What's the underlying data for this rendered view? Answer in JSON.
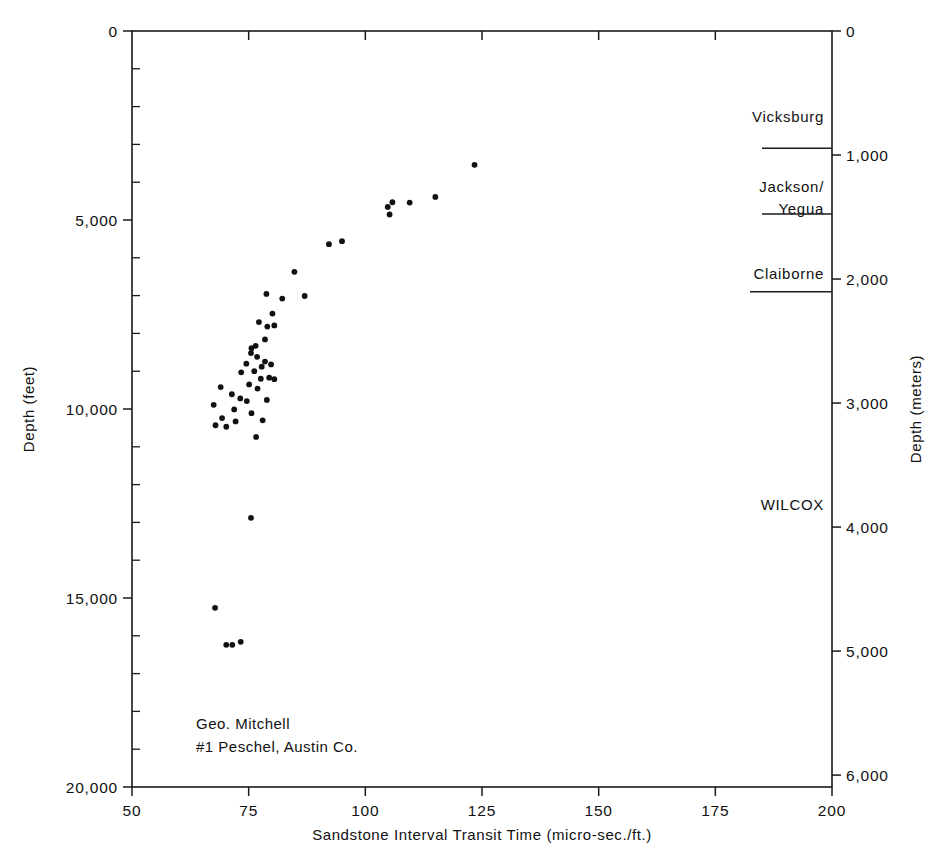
{
  "chart_data": {
    "type": "scatter",
    "title": "",
    "xlabel": "Sandstone Interval Transit Time (micro-sec./ft.)",
    "ylabel": "Depth (feet)",
    "y2label": "Depth (meters)",
    "xlim": [
      50,
      200
    ],
    "ylim": [
      20000,
      0
    ],
    "y2lim": [
      6096,
      0
    ],
    "grid": false,
    "legend": null,
    "xticks": [
      50,
      75,
      100,
      125,
      150,
      175,
      200
    ],
    "xtick_labels": [
      "50",
      "75",
      "100",
      "125",
      "150",
      "175",
      "200"
    ],
    "yticks": [
      0,
      5000,
      10000,
      15000,
      20000
    ],
    "ytick_labels": [
      "0",
      "5,000",
      "10,000",
      "15,000",
      "20,000"
    ],
    "ytick_minor_step": 1000,
    "y2ticks": [
      0,
      1000,
      2000,
      3000,
      4000,
      5000,
      6000
    ],
    "y2tick_labels": [
      "0",
      "1,000",
      "2,000",
      "3,000",
      "4,000",
      "5,000",
      "6,000"
    ],
    "points": [
      {
        "x": 123.4,
        "y": 3540
      },
      {
        "x": 109.5,
        "y": 4540
      },
      {
        "x": 104.8,
        "y": 4655
      },
      {
        "x": 105.8,
        "y": 4530
      },
      {
        "x": 105.2,
        "y": 4855
      },
      {
        "x": 115.0,
        "y": 4390
      },
      {
        "x": 92.2,
        "y": 5640
      },
      {
        "x": 95.0,
        "y": 5560
      },
      {
        "x": 84.8,
        "y": 6370
      },
      {
        "x": 82.2,
        "y": 7080
      },
      {
        "x": 87.0,
        "y": 7010
      },
      {
        "x": 78.8,
        "y": 6955
      },
      {
        "x": 80.1,
        "y": 7475
      },
      {
        "x": 80.5,
        "y": 7790
      },
      {
        "x": 79.0,
        "y": 7820
      },
      {
        "x": 77.2,
        "y": 7700
      },
      {
        "x": 78.5,
        "y": 8160
      },
      {
        "x": 76.5,
        "y": 8330
      },
      {
        "x": 75.6,
        "y": 8390
      },
      {
        "x": 75.5,
        "y": 8520
      },
      {
        "x": 76.8,
        "y": 8620
      },
      {
        "x": 78.5,
        "y": 8745
      },
      {
        "x": 77.8,
        "y": 8880
      },
      {
        "x": 79.8,
        "y": 8820
      },
      {
        "x": 76.2,
        "y": 9000
      },
      {
        "x": 74.5,
        "y": 8800
      },
      {
        "x": 73.4,
        "y": 9030
      },
      {
        "x": 79.4,
        "y": 9170
      },
      {
        "x": 77.6,
        "y": 9200
      },
      {
        "x": 80.5,
        "y": 9210
      },
      {
        "x": 75.1,
        "y": 9350
      },
      {
        "x": 76.9,
        "y": 9460
      },
      {
        "x": 69.0,
        "y": 9420
      },
      {
        "x": 71.4,
        "y": 9610
      },
      {
        "x": 73.2,
        "y": 9720
      },
      {
        "x": 74.6,
        "y": 9790
      },
      {
        "x": 78.9,
        "y": 9760
      },
      {
        "x": 67.5,
        "y": 9890
      },
      {
        "x": 71.9,
        "y": 10010
      },
      {
        "x": 75.6,
        "y": 10110
      },
      {
        "x": 69.3,
        "y": 10240
      },
      {
        "x": 72.2,
        "y": 10330
      },
      {
        "x": 78.0,
        "y": 10300
      },
      {
        "x": 67.9,
        "y": 10430
      },
      {
        "x": 70.2,
        "y": 10470
      },
      {
        "x": 76.6,
        "y": 10740
      },
      {
        "x": 75.5,
        "y": 12880
      },
      {
        "x": 67.8,
        "y": 15260
      },
      {
        "x": 70.2,
        "y": 16240
      },
      {
        "x": 71.5,
        "y": 16240
      },
      {
        "x": 73.3,
        "y": 16160
      }
    ],
    "formations": [
      {
        "name": "Vicksburg",
        "label_y_ft": 2400
      },
      {
        "name": "Jackson/",
        "label_y_ft": 4270
      },
      {
        "name": "Yegua",
        "label_y_ft": 4840
      },
      {
        "name": "Claiborne",
        "label_y_ft": 6550
      },
      {
        "name": "WILCOX",
        "label_y_ft": 12660
      }
    ],
    "formation_boundaries_ft": [
      3100,
      4840,
      6900
    ],
    "annotation": [
      "Geo. Mitchell",
      "#1 Peschel, Austin Co."
    ]
  },
  "colors": {
    "line": "#1a1a1a",
    "marker": "#111111",
    "background": "#ffffff"
  }
}
